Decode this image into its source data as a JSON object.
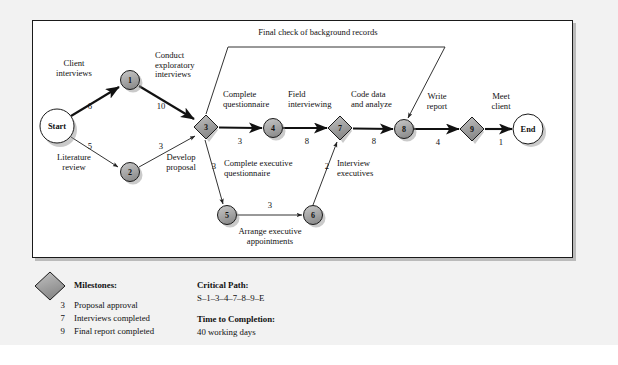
{
  "diagram": {
    "type": "pert-cpm-network",
    "title_top": "Final check of background records",
    "nodes": [
      {
        "id": "S",
        "label": "Start",
        "shape": "circle",
        "x": 57,
        "y": 126,
        "r": 17
      },
      {
        "id": "1",
        "label": "1",
        "shape": "circle",
        "x": 130,
        "y": 80,
        "r": 9.5
      },
      {
        "id": "2",
        "label": "2",
        "shape": "circle",
        "x": 130,
        "y": 172,
        "r": 9.5
      },
      {
        "id": "3",
        "label": "3",
        "shape": "diamond",
        "x": 206,
        "y": 127,
        "r": 12
      },
      {
        "id": "4",
        "label": "4",
        "shape": "circle",
        "x": 273,
        "y": 128,
        "r": 9.5
      },
      {
        "id": "5",
        "label": "5",
        "shape": "circle",
        "x": 227,
        "y": 215,
        "r": 9.5
      },
      {
        "id": "6",
        "label": "6",
        "shape": "circle",
        "x": 313,
        "y": 215,
        "r": 9.5
      },
      {
        "id": "7",
        "label": "7",
        "shape": "diamond",
        "x": 340,
        "y": 128,
        "r": 12
      },
      {
        "id": "8",
        "label": "8",
        "shape": "circle",
        "x": 404,
        "y": 129,
        "r": 9.5
      },
      {
        "id": "9",
        "label": "9",
        "shape": "diamond",
        "x": 472,
        "y": 129,
        "r": 12
      },
      {
        "id": "E",
        "label": "End",
        "shape": "circle",
        "x": 528,
        "y": 129,
        "r": 15
      }
    ],
    "edges": [
      {
        "from": "S",
        "to": "1",
        "activity": "Client interviews",
        "duration": "6",
        "critical": true
      },
      {
        "from": "S",
        "to": "2",
        "activity": "Literature review",
        "duration": "5",
        "critical": false
      },
      {
        "from": "1",
        "to": "3",
        "activity": "Conduct exploratory interviews",
        "duration": "10",
        "critical": true
      },
      {
        "from": "2",
        "to": "3",
        "activity": "Develop proposal",
        "duration": "3",
        "critical": false
      },
      {
        "from": "3",
        "to": "4",
        "activity": "Complete questionnaire",
        "duration": "3",
        "critical": true
      },
      {
        "from": "3",
        "to": "5",
        "activity": "Complete executive questionnaire",
        "duration": "3",
        "critical": false
      },
      {
        "from": "3",
        "to": "8",
        "activity": "Final check of background records",
        "duration": "",
        "critical": false
      },
      {
        "from": "4",
        "to": "7",
        "activity": "Field interviewing",
        "duration": "8",
        "critical": true
      },
      {
        "from": "5",
        "to": "6",
        "activity": "Arrange executive appointments",
        "duration": "3",
        "critical": false
      },
      {
        "from": "6",
        "to": "7",
        "activity": "Interview executives",
        "duration": "2",
        "critical": false
      },
      {
        "from": "7",
        "to": "8",
        "activity": "Code data and analyze",
        "duration": "8",
        "critical": true
      },
      {
        "from": "8",
        "to": "9",
        "activity": "Write report",
        "duration": "4",
        "critical": true
      },
      {
        "from": "9",
        "to": "E",
        "activity": "Meet client",
        "duration": "1",
        "critical": true
      }
    ],
    "activity_labels": [
      {
        "key": "client_interviews",
        "line1": "Client",
        "line2": "interviews",
        "x": 74,
        "y": 64
      },
      {
        "key": "conduct_exploratory",
        "line1": "Conduct",
        "line2": "exploratory",
        "line3": "interviews",
        "x": 182,
        "y": 56
      },
      {
        "key": "literature_review",
        "line1": "Literature",
        "line2": "review",
        "x": 74,
        "y": 158
      },
      {
        "key": "develop_proposal",
        "line1": "Develop",
        "line2": "proposal",
        "x": 181,
        "y": 158
      },
      {
        "key": "complete_questionnaire",
        "line1": "Complete",
        "line2": "questionnaire",
        "x": 246,
        "y": 95
      },
      {
        "key": "field_interviewing",
        "line1": "Field",
        "line2": "interviewing",
        "x": 312,
        "y": 95
      },
      {
        "key": "code_data_analyze",
        "line1": "Code data",
        "line2": "and analyze",
        "x": 380,
        "y": 95
      },
      {
        "key": "write_report",
        "line1": "Write",
        "line2": "report",
        "x": 437,
        "y": 97
      },
      {
        "key": "meet_client",
        "line1": "Meet",
        "line2": "client",
        "x": 501,
        "y": 97
      },
      {
        "key": "complete_exec_questionnaire",
        "line1": "Complete executive",
        "line2": "questionnaire",
        "x": 250,
        "y": 164
      },
      {
        "key": "interview_executives",
        "line1": "Interview",
        "line2": "executives",
        "x": 354,
        "y": 164
      },
      {
        "key": "arrange_exec_appointments",
        "line1": "Arrange executive",
        "line2": "appointments",
        "x": 270,
        "y": 228
      },
      {
        "key": "final_check",
        "line1": "Final check of background records",
        "x": 318,
        "y": 27
      }
    ],
    "duration_labels": [
      {
        "key": "d_s1",
        "value": "6",
        "x": 90,
        "y": 106
      },
      {
        "key": "d_s2",
        "value": "5",
        "x": 90,
        "y": 146
      },
      {
        "key": "d_13",
        "value": "10",
        "x": 161,
        "y": 106
      },
      {
        "key": "d_23",
        "value": "3",
        "x": 161,
        "y": 146
      },
      {
        "key": "d_34",
        "value": "3",
        "x": 240,
        "y": 140
      },
      {
        "key": "d_47",
        "value": "8",
        "x": 307,
        "y": 140
      },
      {
        "key": "d_78",
        "value": "8",
        "x": 374,
        "y": 140
      },
      {
        "key": "d_89",
        "value": "4",
        "x": 438,
        "y": 141
      },
      {
        "key": "d_9e",
        "value": "1",
        "x": 501,
        "y": 141
      },
      {
        "key": "d_35",
        "value": "3",
        "x": 216,
        "y": 165
      },
      {
        "key": "d_56",
        "value": "3",
        "x": 270,
        "y": 205
      },
      {
        "key": "d_67",
        "value": "2",
        "x": 327,
        "y": 165
      }
    ]
  },
  "legend": {
    "milestones_heading": "Milestones:",
    "milestones": [
      {
        "num": "3",
        "label": "Proposal approval"
      },
      {
        "num": "7",
        "label": "Interviews completed"
      },
      {
        "num": "9",
        "label": "Final report completed"
      }
    ],
    "critical_path_heading": "Critical Path:",
    "critical_path_value": "S–1–3–4–7–8–9–E",
    "time_heading": "Time to Completion:",
    "time_value": "40 working days"
  },
  "colors": {
    "node_fill": "#a8a8a8",
    "node_fill_light": "#b8b8b8",
    "milestone_fill": "#9a9a9a",
    "terminal_fill": "#ffffff",
    "stroke": "#1a1a1a",
    "paper": "#f2f2f2",
    "box": "#ffffff",
    "critical_line": "#111111",
    "normal_line": "#444444"
  }
}
